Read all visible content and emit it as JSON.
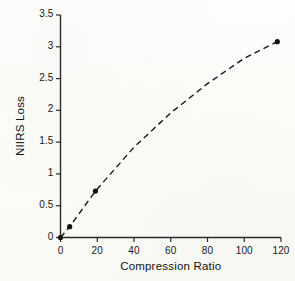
{
  "chart_data": {
    "type": "scatter",
    "title": "",
    "xlabel": "Compression Ratio",
    "ylabel": "NIIRS Loss",
    "xlim": [
      0,
      120
    ],
    "ylim": [
      0,
      3.5
    ],
    "xticks": [
      "0",
      "20",
      "40",
      "60",
      "80",
      "100",
      "120"
    ],
    "xtick_values": [
      0,
      20,
      40,
      60,
      80,
      100,
      120
    ],
    "yticks": [
      "0",
      "0.5",
      "1",
      "1.5",
      "2",
      "2.5",
      "3",
      "3.5"
    ],
    "ytick_values": [
      0,
      0.5,
      1,
      1.5,
      2,
      2.5,
      3,
      3.5
    ],
    "grid": false,
    "legend": null,
    "series": [
      {
        "name": "NIIRS Loss vs Compression Ratio",
        "marker": "filled-circle",
        "line_style": "dashed",
        "color": "#111111",
        "x": [
          0,
          5,
          19,
          118
        ],
        "y": [
          0.0,
          0.17,
          0.73,
          3.08
        ]
      }
    ],
    "trend": {
      "style": "dashed",
      "description": "concave increasing curve through the data points",
      "x": [
        0,
        5,
        19,
        40,
        60,
        80,
        100,
        118
      ],
      "y": [
        0.0,
        0.17,
        0.73,
        1.42,
        1.96,
        2.42,
        2.82,
        3.08
      ]
    }
  },
  "axes": {
    "x_title": "Compression Ratio",
    "y_title": "NIIRS Loss"
  }
}
